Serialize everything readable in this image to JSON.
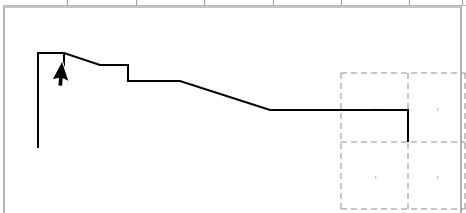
{
  "canvas": {
    "width": 466,
    "height": 213,
    "background": "#ffffff",
    "description": "Line-drawing canvas with stepped descending profile polyline, dashed layout grid at lower-right, and an arrow mouse cursor"
  },
  "frame": {
    "name": "content-frame",
    "x": 3,
    "y": 6,
    "width": 459,
    "height": 207,
    "border_color": "#b0b0b0",
    "top_border_color": "#c4c4c4",
    "fill": "#ffffff"
  },
  "top_strip": {
    "rule_color": "#b9b9b9",
    "tick_color": "#9a9a9a",
    "tick_x_positions": [
      67,
      136,
      204,
      273,
      341,
      409,
      462
    ]
  },
  "dashed_grid": {
    "stroke": "#8c8c8c",
    "stroke_width": 1,
    "dash_pattern": "6 4",
    "x_lines": [
      341,
      408,
      465
    ],
    "y_lines": [
      73,
      142,
      209
    ],
    "cell_dot_color": "#c8c8c8",
    "cell_dots": [
      {
        "x": 375,
        "y": 108
      },
      {
        "x": 437,
        "y": 108
      },
      {
        "x": 375,
        "y": 176
      },
      {
        "x": 437,
        "y": 176
      }
    ]
  },
  "chart_data": {
    "type": "line",
    "title": "",
    "subtitle": "",
    "xlabel": "",
    "ylabel": "",
    "xlim": [
      0,
      466
    ],
    "ylim": [
      213,
      0
    ],
    "grid": false,
    "legend": null,
    "stroke": "#000000",
    "stroke_width": 2,
    "series": [
      {
        "name": "profile",
        "points": [
          [
            38,
            148
          ],
          [
            38,
            53
          ],
          [
            64,
            53
          ],
          [
            100,
            65
          ],
          [
            128,
            65
          ],
          [
            128,
            81
          ],
          [
            180,
            81
          ],
          [
            270,
            110
          ],
          [
            408,
            110
          ],
          [
            408,
            142
          ]
        ]
      },
      {
        "name": "tick-mark",
        "points": [
          [
            64,
            53
          ],
          [
            64,
            67
          ]
        ]
      }
    ]
  },
  "cursor": {
    "name": "mouse-pointer",
    "tip_x": 62,
    "tip_y": 62,
    "fill": "#000000",
    "outline": "#ffffff",
    "rotation_deg": 28
  }
}
